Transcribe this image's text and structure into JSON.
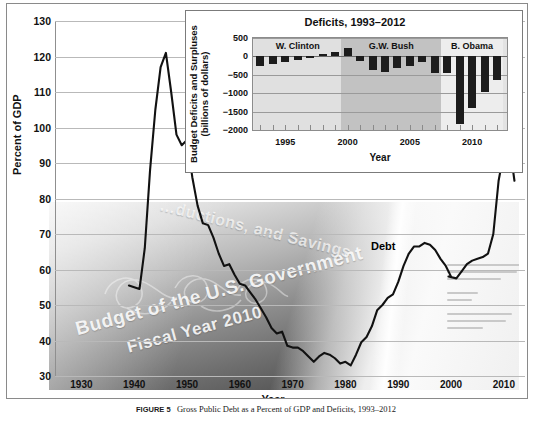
{
  "figure": {
    "caption_label": "FIGURE 5",
    "caption_text": "Gross Public Debt as a Percent of GDP and Deficits, 1993–2012"
  },
  "watermark": {
    "line1": "Budget of the U.S. Government",
    "line2": "Fiscal Year 2010",
    "line3": "…ductions, and Savings"
  },
  "main_chart": {
    "ylabel": "Percent of GDP",
    "xlabel": "Year",
    "series_label": "Debt",
    "yticks": [
      130,
      120,
      110,
      100,
      90,
      80,
      70,
      60,
      50,
      40,
      30
    ],
    "xticks": [
      1930,
      1940,
      1950,
      1960,
      1970,
      1980,
      1990,
      2000,
      2010
    ],
    "line_color": "#111111",
    "grid_color": "#b9b9b9"
  },
  "inset_chart": {
    "title": "Deficits, 1993–2012",
    "ylabel": "Budget Deficits and Surpluses\n(billions of dollars)",
    "ylabel_line1": "Budget Deficits and Surpluses",
    "ylabel_line2": "(billions of dollars)",
    "xlabel": "Year",
    "yticks": [
      500,
      0,
      -500,
      -1000,
      -1500,
      -2000
    ],
    "xticks": [
      1995,
      2000,
      2005,
      2010
    ],
    "bar_color": "#1c1c1c",
    "presidents": [
      {
        "name": "W. Clinton",
        "start": 1993,
        "end": 2000,
        "band_color": "#e0e0e0"
      },
      {
        "name": "G.W. Bush",
        "start": 2000,
        "end": 2008,
        "band_color": "#c2c2c2"
      },
      {
        "name": "B. Obama",
        "start": 2008,
        "end": 2013,
        "band_color": "#ededed"
      }
    ]
  },
  "chart_data": [
    {
      "type": "line",
      "title": "Gross Public Debt as a Percent of GDP",
      "xlabel": "Year",
      "ylabel": "Percent of GDP",
      "ylim": [
        30,
        130
      ],
      "xlim": [
        1925,
        2014
      ],
      "grid": true,
      "series": [
        {
          "name": "Debt",
          "x": [
            1939,
            1940,
            1941,
            1942,
            1943,
            1944,
            1945,
            1946,
            1947,
            1948,
            1949,
            1950,
            1951,
            1952,
            1953,
            1954,
            1955,
            1956,
            1957,
            1958,
            1959,
            1960,
            1961,
            1962,
            1963,
            1964,
            1965,
            1966,
            1967,
            1968,
            1969,
            1970,
            1971,
            1972,
            1973,
            1974,
            1975,
            1976,
            1977,
            1978,
            1979,
            1980,
            1981,
            1982,
            1983,
            1984,
            1985,
            1986,
            1987,
            1988,
            1989,
            1990,
            1991,
            1992,
            1993,
            1994,
            1995,
            1996,
            1997,
            1998,
            1999,
            2000,
            1999.5,
            2001,
            2002,
            2003,
            2004,
            2005,
            2006,
            2007,
            2008,
            2009,
            2010,
            2011,
            2012
          ],
          "y": [
            55.5,
            55.0,
            54.5,
            66.0,
            88.0,
            105.0,
            117.0,
            121.0,
            110.0,
            98.0,
            95.0,
            96.5,
            86.0,
            78.0,
            73.0,
            72.5,
            69.0,
            64.5,
            61.0,
            61.5,
            58.5,
            56.0,
            55.5,
            53.5,
            51.5,
            49.0,
            46.5,
            43.5,
            42.0,
            42.5,
            38.5,
            38.0,
            38.0,
            37.0,
            35.5,
            34.0,
            35.5,
            36.5,
            36.0,
            35.0,
            33.5,
            34.0,
            33.0,
            36.0,
            39.5,
            41.0,
            44.0,
            48.5,
            50.0,
            52.0,
            53.0,
            56.5,
            61.0,
            64.5,
            66.5,
            66.5,
            67.5,
            67.0,
            65.5,
            63.0,
            61.0,
            58.0,
            58.0,
            57.5,
            59.5,
            61.5,
            62.5,
            63.0,
            63.5,
            64.5,
            70.0,
            85.0,
            93.0,
            96.0,
            85.0
          ]
        }
      ]
    },
    {
      "type": "bar",
      "title": "Deficits, 1993–2012",
      "xlabel": "Year",
      "ylabel": "Budget Deficits and Surpluses (billions of dollars)",
      "ylim": [
        -2000,
        500
      ],
      "grid": true,
      "categories": [
        1993,
        1994,
        1995,
        1996,
        1997,
        1998,
        1999,
        2000,
        2001,
        2002,
        2003,
        2004,
        2005,
        2006,
        2007,
        2008,
        2009,
        2010,
        2011,
        2012
      ],
      "values": [
        -255,
        -203,
        -164,
        -107,
        -22,
        69,
        126,
        236,
        -128,
        -378,
        -413,
        -318,
        -248,
        -161,
        -459,
        -459,
        -1850,
        -1400,
        -960,
        -640
      ],
      "series": [
        {
          "name": "Budget Deficits and Surpluses",
          "values": [
            -255,
            -203,
            -164,
            -107,
            -22,
            69,
            126,
            236,
            -128,
            -378,
            -413,
            -318,
            -248,
            -161,
            -459,
            -459,
            -1850,
            -1400,
            -960,
            -640
          ]
        }
      ]
    }
  ]
}
